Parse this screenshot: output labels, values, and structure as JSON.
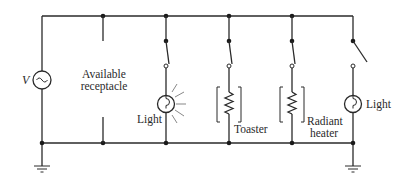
{
  "diagram": {
    "type": "parallel household circuit",
    "source": {
      "label": "V",
      "symbol": "ac-source-tilde"
    },
    "branches": [
      {
        "id": "receptacle",
        "label_line1": "Available",
        "label_line2": "receptacle",
        "has_switch": false
      },
      {
        "id": "light-1",
        "label": "Light",
        "switch_state": "closed",
        "load": "lamp-glowing"
      },
      {
        "id": "toaster",
        "label": "Toaster",
        "switch_state": "closed",
        "load": "resistor-bracketed"
      },
      {
        "id": "radiant-heater",
        "label_line1": "Radiant",
        "label_line2": "heater",
        "switch_state": "closed",
        "load": "resistor-bracketed"
      },
      {
        "id": "light-2",
        "label": "Light",
        "switch_state": "open",
        "load": "lamp-off"
      }
    ],
    "grounds": 2,
    "colors": {
      "line": "#2a2a2a",
      "background": "#ffffff"
    }
  }
}
